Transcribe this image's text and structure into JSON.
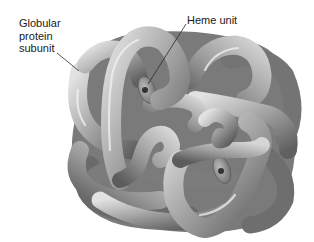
{
  "figure": {
    "labels": {
      "subunit": "Globular protein subunit",
      "subunit_lines": [
        "Globular",
        "protein",
        "subunit"
      ],
      "heme": "Heme unit"
    },
    "colors": {
      "background": "#ffffff",
      "tube_light": "#d9d9d9",
      "tube_mid": "#9a9a9a",
      "tube_dark": "#5a5a5a",
      "label_text": "#1a1a1a",
      "leader_line": "#2a2a2a"
    }
  }
}
